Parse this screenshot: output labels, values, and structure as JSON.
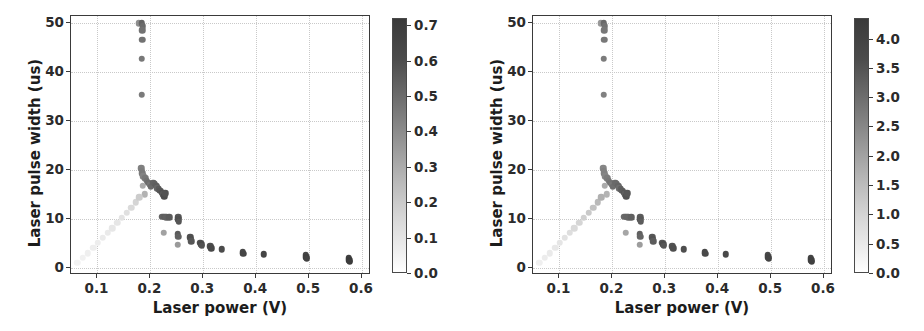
{
  "figure": {
    "width": 924,
    "height": 331,
    "background": "#ffffff",
    "panel_count": 2
  },
  "chart_data": [
    {
      "id": "left",
      "type": "scatter",
      "title": "",
      "xlabel": "Laser power (V)",
      "ylabel": "Laser pulse width (us)",
      "xlim": [
        0.05,
        0.617
      ],
      "ylim": [
        -1.5,
        51.5
      ],
      "xticks": [
        0.1,
        0.2,
        0.3,
        0.4,
        0.5,
        0.6
      ],
      "xticklabels": [
        "0.1",
        "0.2",
        "0.3",
        "0.4",
        "0.5",
        "0.6"
      ],
      "yticks": [
        0,
        10,
        20,
        30,
        40,
        50
      ],
      "yticklabels": [
        "0",
        "10",
        "20",
        "30",
        "40",
        "50"
      ],
      "grid": true,
      "grid_style": "dotted",
      "grid_color": "#c9c9c9",
      "colormap": "gray_r",
      "colorbar": {
        "position": "right",
        "vmin": 0.0,
        "vmax": 0.72,
        "ticks": [
          0.0,
          0.1,
          0.2,
          0.3,
          0.4,
          0.5,
          0.6,
          0.7
        ],
        "ticklabels": [
          "0.0",
          "0.1",
          "0.2",
          "0.3",
          "0.4",
          "0.5",
          "0.6",
          "0.7"
        ]
      },
      "points": [
        {
          "x": 0.178,
          "y": 50.0,
          "c": 0.4
        },
        {
          "x": 0.184,
          "y": 50.0,
          "c": 0.55
        },
        {
          "x": 0.186,
          "y": 49.4,
          "c": 0.52
        },
        {
          "x": 0.185,
          "y": 48.6,
          "c": 0.5
        },
        {
          "x": 0.185,
          "y": 46.6,
          "c": 0.5
        },
        {
          "x": 0.184,
          "y": 42.8,
          "c": 0.48
        },
        {
          "x": 0.184,
          "y": 35.4,
          "c": 0.47
        },
        {
          "x": 0.183,
          "y": 20.3,
          "c": 0.45
        },
        {
          "x": 0.184,
          "y": 19.8,
          "c": 0.46
        },
        {
          "x": 0.185,
          "y": 19.3,
          "c": 0.47
        },
        {
          "x": 0.187,
          "y": 18.7,
          "c": 0.44
        },
        {
          "x": 0.19,
          "y": 18.3,
          "c": 0.48
        },
        {
          "x": 0.193,
          "y": 17.8,
          "c": 0.5
        },
        {
          "x": 0.196,
          "y": 17.4,
          "c": 0.52
        },
        {
          "x": 0.199,
          "y": 17.0,
          "c": 0.49
        },
        {
          "x": 0.201,
          "y": 16.6,
          "c": 0.53
        },
        {
          "x": 0.205,
          "y": 17.4,
          "c": 0.55
        },
        {
          "x": 0.208,
          "y": 17.2,
          "c": 0.56
        },
        {
          "x": 0.211,
          "y": 16.8,
          "c": 0.57
        },
        {
          "x": 0.213,
          "y": 16.3,
          "c": 0.54
        },
        {
          "x": 0.216,
          "y": 16.0,
          "c": 0.58
        },
        {
          "x": 0.219,
          "y": 15.7,
          "c": 0.6
        },
        {
          "x": 0.222,
          "y": 15.3,
          "c": 0.62
        },
        {
          "x": 0.224,
          "y": 15.0,
          "c": 0.59
        },
        {
          "x": 0.226,
          "y": 14.6,
          "c": 0.63
        },
        {
          "x": 0.228,
          "y": 15.2,
          "c": 0.61
        },
        {
          "x": 0.186,
          "y": 16.8,
          "c": 0.3
        },
        {
          "x": 0.189,
          "y": 15.0,
          "c": 0.27
        },
        {
          "x": 0.222,
          "y": 10.4,
          "c": 0.55
        },
        {
          "x": 0.226,
          "y": 10.4,
          "c": 0.57
        },
        {
          "x": 0.23,
          "y": 10.3,
          "c": 0.56
        },
        {
          "x": 0.236,
          "y": 10.3,
          "c": 0.58
        },
        {
          "x": 0.253,
          "y": 10.3,
          "c": 0.6
        },
        {
          "x": 0.253,
          "y": 9.9,
          "c": 0.62
        },
        {
          "x": 0.254,
          "y": 9.4,
          "c": 0.6
        },
        {
          "x": 0.225,
          "y": 7.1,
          "c": 0.33
        },
        {
          "x": 0.252,
          "y": 6.8,
          "c": 0.58
        },
        {
          "x": 0.253,
          "y": 6.3,
          "c": 0.56
        },
        {
          "x": 0.252,
          "y": 4.7,
          "c": 0.36
        },
        {
          "x": 0.275,
          "y": 6.2,
          "c": 0.62
        },
        {
          "x": 0.276,
          "y": 5.8,
          "c": 0.63
        },
        {
          "x": 0.277,
          "y": 5.4,
          "c": 0.6
        },
        {
          "x": 0.294,
          "y": 5.1,
          "c": 0.62
        },
        {
          "x": 0.296,
          "y": 4.8,
          "c": 0.64
        },
        {
          "x": 0.297,
          "y": 4.5,
          "c": 0.61
        },
        {
          "x": 0.313,
          "y": 4.4,
          "c": 0.63
        },
        {
          "x": 0.315,
          "y": 4.0,
          "c": 0.65
        },
        {
          "x": 0.335,
          "y": 3.8,
          "c": 0.64
        },
        {
          "x": 0.375,
          "y": 3.2,
          "c": 0.65
        },
        {
          "x": 0.376,
          "y": 2.8,
          "c": 0.66
        },
        {
          "x": 0.414,
          "y": 2.7,
          "c": 0.66
        },
        {
          "x": 0.494,
          "y": 2.5,
          "c": 0.66
        },
        {
          "x": 0.495,
          "y": 2.1,
          "c": 0.68
        },
        {
          "x": 0.496,
          "y": 1.8,
          "c": 0.67
        },
        {
          "x": 0.575,
          "y": 1.9,
          "c": 0.68
        },
        {
          "x": 0.576,
          "y": 1.5,
          "c": 0.7
        },
        {
          "x": 0.577,
          "y": 1.2,
          "c": 0.69
        },
        {
          "x": 0.062,
          "y": 1.0,
          "c": 0.045
        },
        {
          "x": 0.072,
          "y": 2.0,
          "c": 0.05
        },
        {
          "x": 0.082,
          "y": 3.0,
          "c": 0.055
        },
        {
          "x": 0.092,
          "y": 4.1,
          "c": 0.06
        },
        {
          "x": 0.101,
          "y": 5.1,
          "c": 0.065
        },
        {
          "x": 0.11,
          "y": 6.1,
          "c": 0.07
        },
        {
          "x": 0.119,
          "y": 7.1,
          "c": 0.075
        },
        {
          "x": 0.128,
          "y": 8.1,
          "c": 0.085
        },
        {
          "x": 0.137,
          "y": 9.2,
          "c": 0.09
        },
        {
          "x": 0.146,
          "y": 10.2,
          "c": 0.1
        },
        {
          "x": 0.155,
          "y": 11.2,
          "c": 0.11
        },
        {
          "x": 0.164,
          "y": 12.3,
          "c": 0.13
        },
        {
          "x": 0.172,
          "y": 13.4,
          "c": 0.15
        },
        {
          "x": 0.179,
          "y": 14.4,
          "c": 0.18
        }
      ]
    },
    {
      "id": "right",
      "type": "scatter",
      "title": "",
      "xlabel": "Laser power (V)",
      "ylabel": "Laser pulse width (us)",
      "xlim": [
        0.05,
        0.617
      ],
      "ylim": [
        -1.5,
        51.5
      ],
      "xticks": [
        0.1,
        0.2,
        0.3,
        0.4,
        0.5,
        0.6
      ],
      "xticklabels": [
        "0.1",
        "0.2",
        "0.3",
        "0.4",
        "0.5",
        "0.6"
      ],
      "yticks": [
        0,
        10,
        20,
        30,
        40,
        50
      ],
      "yticklabels": [
        "0",
        "10",
        "20",
        "30",
        "40",
        "50"
      ],
      "grid": true,
      "grid_style": "dotted",
      "grid_color": "#c9c9c9",
      "colormap": "gray_r",
      "colorbar": {
        "position": "right",
        "vmin": 0.0,
        "vmax": 4.35,
        "ticks": [
          0.0,
          0.5,
          1.0,
          1.5,
          2.0,
          2.5,
          3.0,
          3.5,
          4.0
        ],
        "ticklabels": [
          "0.0",
          "0.5",
          "1.0",
          "1.5",
          "2.0",
          "2.5",
          "3.0",
          "3.5",
          "4.0"
        ]
      },
      "points": [
        {
          "x": 0.178,
          "y": 50.0,
          "c": 2.2
        },
        {
          "x": 0.184,
          "y": 50.0,
          "c": 3.2
        },
        {
          "x": 0.186,
          "y": 49.4,
          "c": 3.0
        },
        {
          "x": 0.185,
          "y": 48.6,
          "c": 2.9
        },
        {
          "x": 0.185,
          "y": 46.6,
          "c": 2.9
        },
        {
          "x": 0.184,
          "y": 42.8,
          "c": 2.8
        },
        {
          "x": 0.184,
          "y": 35.4,
          "c": 2.7
        },
        {
          "x": 0.183,
          "y": 20.3,
          "c": 2.6
        },
        {
          "x": 0.184,
          "y": 19.8,
          "c": 2.7
        },
        {
          "x": 0.185,
          "y": 19.3,
          "c": 2.7
        },
        {
          "x": 0.187,
          "y": 18.7,
          "c": 2.6
        },
        {
          "x": 0.19,
          "y": 18.3,
          "c": 2.8
        },
        {
          "x": 0.193,
          "y": 17.8,
          "c": 2.9
        },
        {
          "x": 0.196,
          "y": 17.4,
          "c": 3.0
        },
        {
          "x": 0.199,
          "y": 17.0,
          "c": 2.9
        },
        {
          "x": 0.201,
          "y": 16.6,
          "c": 3.1
        },
        {
          "x": 0.205,
          "y": 17.4,
          "c": 3.2
        },
        {
          "x": 0.208,
          "y": 17.2,
          "c": 3.2
        },
        {
          "x": 0.211,
          "y": 16.8,
          "c": 3.3
        },
        {
          "x": 0.213,
          "y": 16.3,
          "c": 3.1
        },
        {
          "x": 0.216,
          "y": 16.0,
          "c": 3.4
        },
        {
          "x": 0.219,
          "y": 15.7,
          "c": 3.5
        },
        {
          "x": 0.222,
          "y": 15.3,
          "c": 3.6
        },
        {
          "x": 0.224,
          "y": 15.0,
          "c": 3.4
        },
        {
          "x": 0.226,
          "y": 14.6,
          "c": 3.7
        },
        {
          "x": 0.228,
          "y": 15.2,
          "c": 3.6
        },
        {
          "x": 0.186,
          "y": 16.8,
          "c": 1.8
        },
        {
          "x": 0.189,
          "y": 15.0,
          "c": 1.6
        },
        {
          "x": 0.222,
          "y": 10.4,
          "c": 3.2
        },
        {
          "x": 0.226,
          "y": 10.4,
          "c": 3.3
        },
        {
          "x": 0.23,
          "y": 10.3,
          "c": 3.3
        },
        {
          "x": 0.236,
          "y": 10.3,
          "c": 3.4
        },
        {
          "x": 0.253,
          "y": 10.3,
          "c": 3.5
        },
        {
          "x": 0.253,
          "y": 9.9,
          "c": 3.6
        },
        {
          "x": 0.254,
          "y": 9.4,
          "c": 3.5
        },
        {
          "x": 0.225,
          "y": 7.1,
          "c": 1.9
        },
        {
          "x": 0.252,
          "y": 6.8,
          "c": 3.4
        },
        {
          "x": 0.253,
          "y": 6.3,
          "c": 3.3
        },
        {
          "x": 0.252,
          "y": 4.7,
          "c": 2.1
        },
        {
          "x": 0.275,
          "y": 6.2,
          "c": 3.6
        },
        {
          "x": 0.276,
          "y": 5.8,
          "c": 3.7
        },
        {
          "x": 0.277,
          "y": 5.4,
          "c": 3.5
        },
        {
          "x": 0.294,
          "y": 5.1,
          "c": 3.6
        },
        {
          "x": 0.296,
          "y": 4.8,
          "c": 3.8
        },
        {
          "x": 0.297,
          "y": 4.5,
          "c": 3.6
        },
        {
          "x": 0.313,
          "y": 4.4,
          "c": 3.7
        },
        {
          "x": 0.315,
          "y": 4.0,
          "c": 3.8
        },
        {
          "x": 0.335,
          "y": 3.8,
          "c": 3.8
        },
        {
          "x": 0.375,
          "y": 3.2,
          "c": 3.9
        },
        {
          "x": 0.376,
          "y": 2.8,
          "c": 3.9
        },
        {
          "x": 0.414,
          "y": 2.7,
          "c": 3.9
        },
        {
          "x": 0.494,
          "y": 2.5,
          "c": 3.9
        },
        {
          "x": 0.495,
          "y": 2.1,
          "c": 4.0
        },
        {
          "x": 0.496,
          "y": 1.8,
          "c": 4.0
        },
        {
          "x": 0.575,
          "y": 1.9,
          "c": 4.0
        },
        {
          "x": 0.576,
          "y": 1.5,
          "c": 4.1
        },
        {
          "x": 0.577,
          "y": 1.2,
          "c": 4.1
        },
        {
          "x": 0.062,
          "y": 1.0,
          "c": 0.35
        },
        {
          "x": 0.072,
          "y": 2.0,
          "c": 0.4
        },
        {
          "x": 0.082,
          "y": 3.0,
          "c": 0.45
        },
        {
          "x": 0.092,
          "y": 4.1,
          "c": 0.5
        },
        {
          "x": 0.101,
          "y": 5.1,
          "c": 0.55
        },
        {
          "x": 0.11,
          "y": 6.1,
          "c": 0.62
        },
        {
          "x": 0.119,
          "y": 7.1,
          "c": 0.7
        },
        {
          "x": 0.128,
          "y": 8.1,
          "c": 0.8
        },
        {
          "x": 0.137,
          "y": 9.2,
          "c": 0.9
        },
        {
          "x": 0.146,
          "y": 10.2,
          "c": 1.0
        },
        {
          "x": 0.155,
          "y": 11.2,
          "c": 1.15
        },
        {
          "x": 0.164,
          "y": 12.3,
          "c": 1.3
        },
        {
          "x": 0.172,
          "y": 13.4,
          "c": 1.5
        },
        {
          "x": 0.179,
          "y": 14.4,
          "c": 1.7
        }
      ]
    }
  ]
}
